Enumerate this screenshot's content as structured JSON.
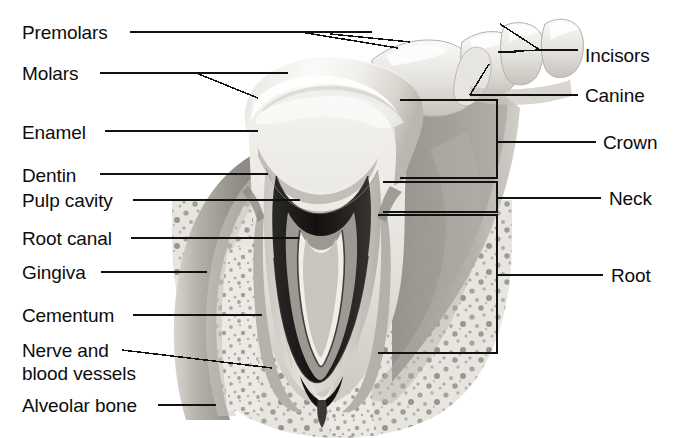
{
  "figure": {
    "width": 676,
    "height": 438,
    "background_color": "#ffffff",
    "line_color": "#111111",
    "font_size_px": 19
  },
  "labels_left": [
    {
      "id": "premolars",
      "text": "Premolars",
      "x": 22,
      "y": 22,
      "leader_y": 32,
      "leader_x1": 130,
      "leader_x2": 372
    },
    {
      "id": "molars",
      "text": "Molars",
      "x": 22,
      "y": 63,
      "leader_y": 73,
      "leader_x1": 100,
      "leader_x2": 285
    },
    {
      "id": "enamel",
      "text": "Enamel",
      "x": 22,
      "y": 122,
      "leader_y": 131,
      "leader_x1": 105,
      "leader_x2": 258
    },
    {
      "id": "dentin",
      "text": "Dentin",
      "x": 22,
      "y": 165,
      "leader_y": 174,
      "leader_x1": 100,
      "leader_x2": 268
    },
    {
      "id": "pulp-cavity",
      "text": "Pulp cavity",
      "x": 22,
      "y": 190,
      "leader_y": 200,
      "leader_x1": 133,
      "leader_x2": 300
    },
    {
      "id": "root-canal",
      "text": "Root canal",
      "x": 22,
      "y": 228,
      "leader_y": 238,
      "leader_x1": 131,
      "leader_x2": 300
    },
    {
      "id": "gingiva",
      "text": "Gingiva",
      "x": 22,
      "y": 262,
      "leader_y": 272,
      "leader_x1": 101,
      "leader_x2": 205
    },
    {
      "id": "cementum",
      "text": "Cementum",
      "x": 22,
      "y": 305,
      "leader_y": 315,
      "leader_x1": 133,
      "leader_x2": 258
    },
    {
      "id": "nerve-and-blood-vessels-line1",
      "text": "Nerve and",
      "x": 22,
      "y": 340,
      "leader_y": 350,
      "leader_x1": 122,
      "leader_x2": 265
    },
    {
      "id": "nerve-and-blood-vessels-line2",
      "text": "blood vessels",
      "x": 22,
      "y": 363,
      "leader_y": null,
      "leader_x1": null,
      "leader_x2": null
    },
    {
      "id": "alveolar-bone",
      "text": "Alveolar bone",
      "x": 22,
      "y": 395,
      "leader_y": 405,
      "leader_x1": 158,
      "leader_x2": 212
    }
  ],
  "labels_right": [
    {
      "id": "incisors",
      "text": "Incisors",
      "x": 585,
      "y": 45,
      "leader_y": 55,
      "leader_x1": 500,
      "leader_x2": 578
    },
    {
      "id": "canine",
      "text": "Canine",
      "x": 585,
      "y": 85,
      "leader_y": 95,
      "leader_x1": 470,
      "leader_x2": 578
    },
    {
      "id": "crown",
      "text": "Crown",
      "x": 603,
      "y": 132,
      "leader_y": 142,
      "leader_x1": 497,
      "leader_x2": 596
    },
    {
      "id": "neck",
      "text": "Neck",
      "x": 609,
      "y": 188,
      "leader_y": 198,
      "leader_x1": 497,
      "leader_x2": 601
    },
    {
      "id": "root",
      "text": "Root",
      "x": 611,
      "y": 265,
      "leader_y": 275,
      "leader_x1": 497,
      "leader_x2": 603
    }
  ],
  "brackets": [
    {
      "id": "crown-bracket",
      "label": "Crown",
      "left": 400,
      "right": 497,
      "top": 100,
      "bottom": 178
    },
    {
      "id": "neck-bracket",
      "label": "Neck",
      "left": 383,
      "right": 497,
      "top": 182,
      "bottom": 212
    },
    {
      "id": "root-bracket",
      "label": "Root",
      "left": 378,
      "right": 497,
      "top": 215,
      "bottom": 353
    }
  ],
  "anatomy_parts": [
    {
      "name": "premolars",
      "description": "upper premolar teeth crowns, far left of arch"
    },
    {
      "name": "molars",
      "description": "large molar shown in cross-section"
    },
    {
      "name": "enamel",
      "description": "outer white hard layer of crown"
    },
    {
      "name": "dentin",
      "description": "light gray layer beneath enamel"
    },
    {
      "name": "pulp-cavity",
      "description": "dark chamber in center of crown"
    },
    {
      "name": "root-canal",
      "description": "narrow dark channel running down root"
    },
    {
      "name": "gingiva",
      "description": "gum tissue, mid gray band"
    },
    {
      "name": "cementum",
      "description": "thin layer covering root surface"
    },
    {
      "name": "nerve-and-blood-vessels",
      "description": "bundle entering apex of root"
    },
    {
      "name": "alveolar-bone",
      "description": "speckled spongy bone surrounding root"
    },
    {
      "name": "incisors",
      "description": "front cutting teeth, right of arch"
    },
    {
      "name": "canine",
      "description": "pointed tooth between incisors and premolars"
    },
    {
      "name": "crown",
      "description": "portion of tooth above the gum line"
    },
    {
      "name": "neck",
      "description": "constricted region at the gum line"
    },
    {
      "name": "root",
      "description": "portion of tooth embedded in bone"
    }
  ]
}
